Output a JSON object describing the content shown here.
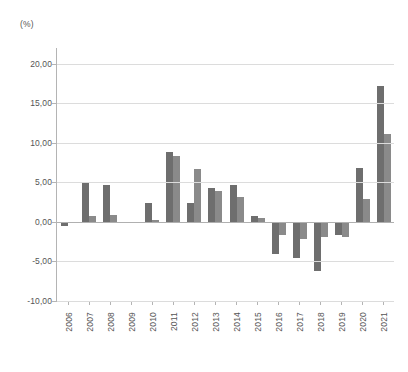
{
  "unit_label": "(%)",
  "chart_data": {
    "type": "bar",
    "title": "",
    "subtitle": "",
    "xlabel": "",
    "ylabel": "(%)",
    "ylim": [
      -10.0,
      22.0
    ],
    "yticks": [
      20.0,
      15.0,
      10.0,
      5.0,
      0.0,
      -5.0,
      -10.0
    ],
    "ytick_labels": [
      "20,00",
      "15,00",
      "10,00",
      "5,00",
      "0,00",
      "-5,00",
      "-10,00"
    ],
    "grid": true,
    "legend": "none",
    "decimal_separator": ",",
    "categories": [
      "2006",
      "2007",
      "2008",
      "2009",
      "2010",
      "2011",
      "2012",
      "2013",
      "2014",
      "2015",
      "2016",
      "2017",
      "2018",
      "2019",
      "2020",
      "2021"
    ],
    "series": [
      {
        "name": "series-1",
        "color": "#6e6e6e",
        "values": [
          -0.5,
          5.0,
          4.7,
          0.0,
          2.4,
          8.9,
          2.4,
          4.3,
          4.7,
          0.7,
          -4.0,
          -4.5,
          -6.2,
          -1.6,
          6.8,
          17.2
        ]
      },
      {
        "name": "series-2",
        "color": "#8a8a8a",
        "values": [
          0.0,
          0.8,
          0.9,
          0.0,
          0.3,
          8.3,
          6.7,
          3.9,
          3.1,
          0.5,
          -1.7,
          -2.1,
          -1.9,
          -1.9,
          2.9,
          11.1
        ]
      }
    ]
  }
}
